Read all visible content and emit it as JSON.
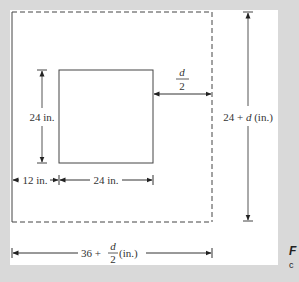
{
  "figure": {
    "labels": {
      "inner_height": "24 in.",
      "offset_d2_num": "d",
      "offset_d2_den": "2",
      "outer_height_prefix": "24 + ",
      "outer_height_var": "d",
      "outer_height_suffix": " (in.)",
      "left_margin": "12 in.",
      "inner_width": "24 in.",
      "outer_width_prefix": "36 + ",
      "outer_width_num": "d",
      "outer_width_den": "2",
      "outer_width_suffix": " (in.)"
    },
    "caption_fragments": [
      "F",
      "c"
    ]
  },
  "colors": {
    "background": "#d9d9d9",
    "panel": "#ffffff",
    "line": "#444444"
  }
}
